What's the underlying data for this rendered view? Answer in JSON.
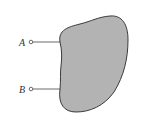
{
  "diagram": {
    "type": "two-terminal network",
    "terminals": [
      {
        "label": "A",
        "y": 42
      },
      {
        "label": "B",
        "y": 89
      }
    ],
    "network": {
      "fill": "#b3b3b3",
      "stroke": "#3a3a3a"
    }
  }
}
